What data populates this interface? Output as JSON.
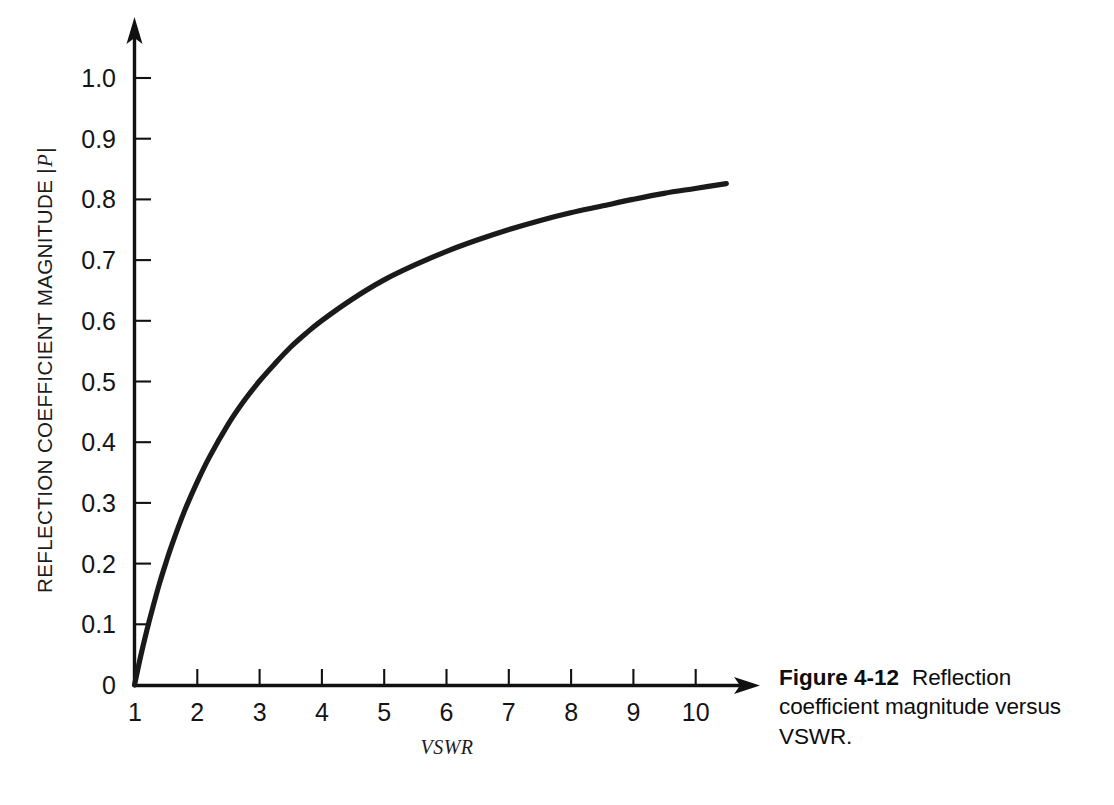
{
  "figure": {
    "caption_label": "Figure 4-12",
    "caption_text": "Reflection coefficient magnitude versus VSWR."
  },
  "axes": {
    "y_label_prefix": "REFLECTION COEFFICIENT MAGNITUDE |",
    "y_label_symbol": "P",
    "y_label_suffix": "|",
    "x_label": "VSWR",
    "y_ticks": [
      "0",
      "0.1",
      "0.2",
      "0.3",
      "0.4",
      "0.5",
      "0.6",
      "0.7",
      "0.8",
      "0.9",
      "1.0"
    ],
    "x_ticks": [
      "1",
      "2",
      "3",
      "4",
      "5",
      "6",
      "7",
      "8",
      "9",
      "10"
    ],
    "axis_color": "#111111",
    "curve_color": "#1a1a1a"
  },
  "chart_data": {
    "type": "line",
    "title": "Reflection coefficient magnitude versus VSWR",
    "xlabel": "VSWR",
    "ylabel": "REFLECTION COEFFICIENT MAGNITUDE |P|",
    "xlim": [
      1,
      10.5
    ],
    "ylim": [
      0,
      1.0
    ],
    "xticks": [
      1,
      2,
      3,
      4,
      5,
      6,
      7,
      8,
      9,
      10
    ],
    "yticks": [
      0,
      0.1,
      0.2,
      0.3,
      0.4,
      0.5,
      0.6,
      0.7,
      0.8,
      0.9,
      1.0
    ],
    "grid": false,
    "legend": "none",
    "formula": "|P| = (VSWR - 1) / (VSWR + 1)",
    "series": [
      {
        "name": "Reflection coefficient magnitude",
        "x": [
          1.0,
          1.1,
          1.2,
          1.3,
          1.4,
          1.5,
          1.6,
          1.8,
          2.0,
          2.2,
          2.5,
          2.75,
          3.0,
          3.25,
          3.5,
          3.75,
          4.0,
          4.5,
          5.0,
          5.5,
          6.0,
          6.5,
          7.0,
          7.5,
          8.0,
          8.5,
          9.0,
          9.5,
          10.0,
          10.5
        ],
        "y": [
          0.0,
          0.048,
          0.091,
          0.13,
          0.167,
          0.2,
          0.231,
          0.286,
          0.333,
          0.375,
          0.429,
          0.467,
          0.5,
          0.529,
          0.556,
          0.579,
          0.6,
          0.636,
          0.667,
          0.692,
          0.714,
          0.733,
          0.75,
          0.765,
          0.778,
          0.789,
          0.8,
          0.81,
          0.818,
          0.826
        ]
      }
    ]
  }
}
